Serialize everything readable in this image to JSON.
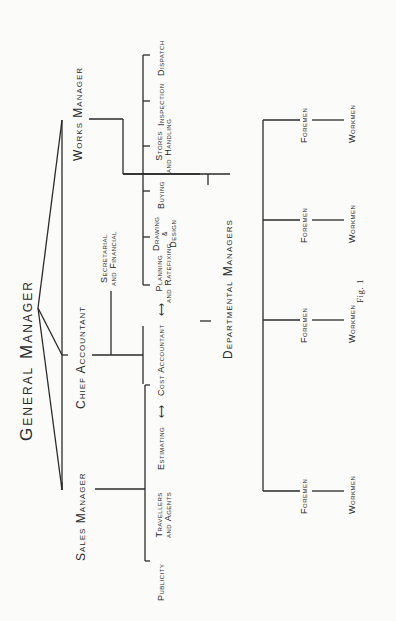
{
  "figure": {
    "caption": "Fig. 1",
    "root": {
      "label": "General Manager"
    },
    "level1": [
      {
        "label": "Sales Manager"
      },
      {
        "label": "Chief Accountant"
      },
      {
        "label": "Works Manager"
      }
    ],
    "sales_children": [
      {
        "label": "Publicity"
      },
      {
        "label_line1": "Travellers",
        "label_line2": "and Agents"
      },
      {
        "label": "Estimating"
      }
    ],
    "accountant_children": {
      "secretarial_line1": "Secretarial",
      "secretarial_line2": "and Financial",
      "cost_accountant": "Cost Accountant",
      "arrow_left": "⟷",
      "arrow_right": "⟷"
    },
    "works_children": [
      {
        "label_line1": "Planning",
        "label_line2": "and Ratefixing"
      },
      {
        "label_line1": "Drawing",
        "label_amp": "&",
        "label_line2": "Design"
      },
      {
        "label": "Buying"
      },
      {
        "label_line1": "Stores",
        "label_line2": "and Handling"
      },
      {
        "label": "Inspection"
      },
      {
        "label": "Dispatch"
      }
    ],
    "departmental": {
      "label": "Departmental Managers",
      "groups": [
        {
          "foremen": "Foremen",
          "workmen": "Workmen"
        },
        {
          "foremen": "Foremen",
          "workmen": "Workmen"
        },
        {
          "foremen": "Foremen",
          "workmen": "Workmen"
        },
        {
          "foremen": "Foremen",
          "workmen": "Workmen"
        }
      ]
    }
  }
}
